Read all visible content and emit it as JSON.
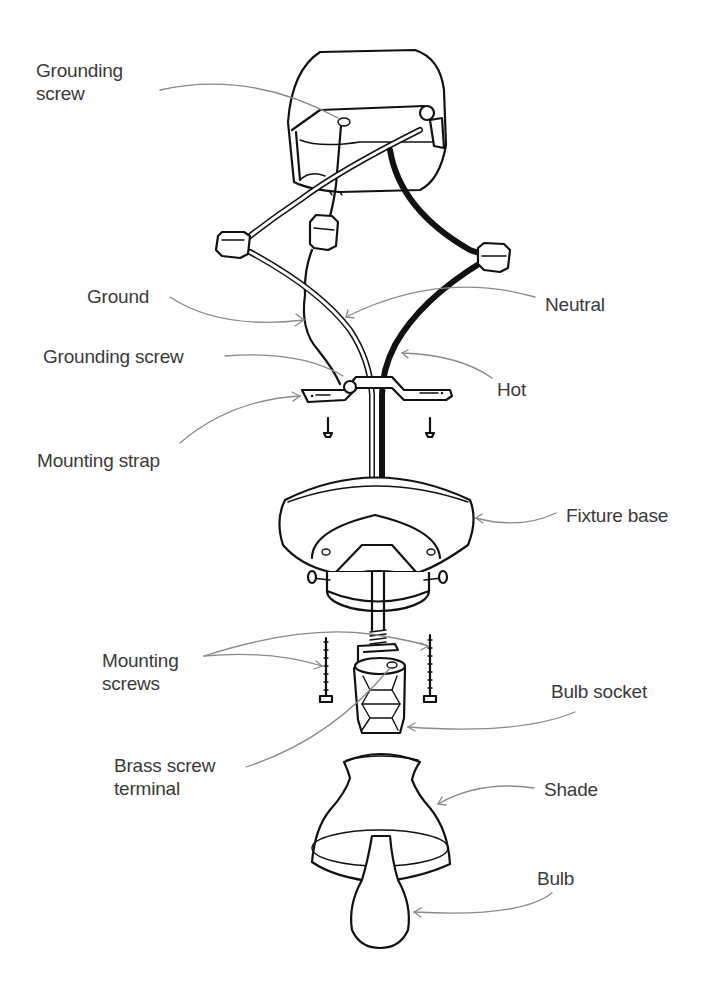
{
  "diagram": {
    "colors": {
      "line": "#111111",
      "leader": "#8a8a8a",
      "label_text": "#3a3a3a",
      "background": "#ffffff"
    },
    "labels": [
      {
        "id": "grounding-screw-top",
        "lines": [
          "Grounding",
          "screw"
        ],
        "x": 36,
        "y": 71
      },
      {
        "id": "ground",
        "lines": [
          "Ground"
        ],
        "x": 87,
        "y": 286
      },
      {
        "id": "neutral",
        "lines": [
          "Neutral"
        ],
        "x": 545,
        "y": 294
      },
      {
        "id": "grounding-screw-strap",
        "lines": [
          "Grounding screw"
        ],
        "x": 43,
        "y": 345
      },
      {
        "id": "hot",
        "lines": [
          "Hot"
        ],
        "x": 497,
        "y": 378
      },
      {
        "id": "mounting-strap",
        "lines": [
          "Mounting strap"
        ],
        "x": 37,
        "y": 448
      },
      {
        "id": "fixture-base",
        "lines": [
          "Fixture base"
        ],
        "x": 566,
        "y": 505
      },
      {
        "id": "mounting-screws",
        "lines": [
          "Mounting",
          "screws"
        ],
        "x": 102,
        "y": 650
      },
      {
        "id": "bulb-socket",
        "lines": [
          "Bulb socket"
        ],
        "x": 551,
        "y": 681
      },
      {
        "id": "brass-screw-terminal",
        "lines": [
          "Brass screw",
          "terminal"
        ],
        "x": 114,
        "y": 755
      },
      {
        "id": "shade",
        "lines": [
          "Shade"
        ],
        "x": 544,
        "y": 778
      },
      {
        "id": "bulb",
        "lines": [
          "Bulb"
        ],
        "x": 537,
        "y": 868
      }
    ],
    "components": [
      "junction-box",
      "wire-nut-ground",
      "wire-nut-neutral",
      "wire-nut-hot",
      "ground-wire",
      "neutral-wire",
      "hot-wire",
      "mounting-strap",
      "strap-screw-left",
      "strap-screw-right",
      "fixture-base",
      "base-side-screws",
      "threaded-nipple",
      "mounting-screw-left",
      "mounting-screw-right",
      "bulb-socket",
      "shade",
      "bulb"
    ]
  }
}
